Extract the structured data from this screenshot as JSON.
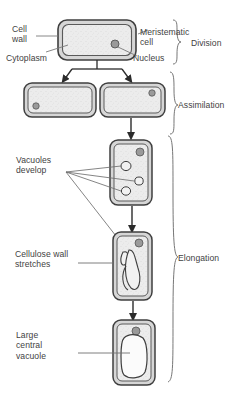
{
  "diagram": {
    "palette": {
      "outline": "#3f3f3f",
      "wall_fill": "#d8d8d8",
      "cytoplasm_fill": "#ebebeb",
      "nucleus_fill": "#a8a8a8",
      "text": "#3f3f3f",
      "leader": "#7a7a7a",
      "background": "#ffffff"
    },
    "labels": {
      "cell_wall": "Cell\nwall",
      "cytoplasm": "Cytoplasm",
      "meristematic_cell": "Meristematic\ncell",
      "nucleus": "Nucleus",
      "vacuoles_develop": "Vacuoles\ndevelop",
      "cellulose_wall_stretches": "Cellulose wall\nstretches",
      "large_central_vacuole": "Large\ncentral\nvacuole"
    },
    "stages": [
      {
        "name": "division",
        "label": "Division"
      },
      {
        "name": "assimilation",
        "label": "Assimilation"
      },
      {
        "name": "elongation",
        "label": "Elongation"
      }
    ],
    "cells": [
      {
        "name": "meristematic-cell",
        "stage": "division",
        "shape": "wide-rounded-rect",
        "x": 58,
        "y": 20,
        "w": 78,
        "h": 40,
        "nucleus": {
          "cx": 115,
          "cy": 44,
          "r": 4
        },
        "vacuoles": 0
      },
      {
        "name": "daughter-cell-left",
        "stage": "assimilation",
        "shape": "wide-rounded-rect",
        "x": 24,
        "y": 83,
        "w": 72,
        "h": 34,
        "nucleus": {
          "cx": 36,
          "cy": 105,
          "r": 3.2
        },
        "vacuoles": 0
      },
      {
        "name": "daughter-cell-right",
        "stage": "assimilation",
        "shape": "wide-rounded-rect",
        "x": 100,
        "y": 83,
        "w": 65,
        "h": 34,
        "nucleus": {
          "cx": 152,
          "cy": 93,
          "r": 3.2
        },
        "vacuoles": 0
      },
      {
        "name": "vacuolating-cell",
        "stage": "elongation",
        "shape": "tall-rounded-rect",
        "x": 110,
        "y": 140,
        "w": 42,
        "h": 65,
        "nucleus": {
          "cx": 140,
          "cy": 152,
          "r": 4
        },
        "vacuoles": 3
      },
      {
        "name": "elongating-cell",
        "stage": "elongation",
        "shape": "tall-rounded-rect",
        "x": 113,
        "y": 232,
        "w": 39,
        "h": 68,
        "nucleus": {
          "cx": 139,
          "cy": 243,
          "r": 4
        },
        "vacuoles": 1
      },
      {
        "name": "mature-cell",
        "stage": "elongation",
        "shape": "tall-rounded-rect",
        "x": 113,
        "y": 320,
        "w": 42,
        "h": 65,
        "nucleus": {
          "cx": 136,
          "cy": 332,
          "r": 4
        },
        "vacuoles": 1
      }
    ],
    "arrows": [
      {
        "name": "division-arrow-left",
        "from_x": 97,
        "from_y": 62,
        "to_x": 60,
        "to_y": 80
      },
      {
        "name": "division-arrow-right",
        "from_x": 97,
        "from_y": 62,
        "to_x": 130,
        "to_y": 80
      },
      {
        "name": "assimilation-arrow",
        "from_x": 131,
        "from_y": 118,
        "to_x": 131,
        "to_y": 138
      },
      {
        "name": "elongation-arrow-1",
        "from_x": 132,
        "from_y": 207,
        "to_x": 132,
        "to_y": 230
      },
      {
        "name": "elongation-arrow-2",
        "from_x": 133,
        "from_y": 302,
        "to_x": 133,
        "to_y": 318
      }
    ]
  }
}
